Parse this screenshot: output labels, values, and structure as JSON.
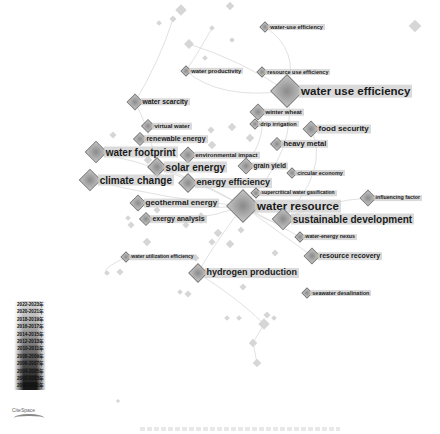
{
  "figure": {
    "title": "",
    "type": "keyword co-occurrence network (CiteSpace)",
    "caption_visible": false
  },
  "legend": {
    "items": [
      {
        "label": "2022-2023年",
        "color": "#cfcfcf"
      },
      {
        "label": "2020-2021年",
        "color": "#c2c2c2"
      },
      {
        "label": "2018-2019年",
        "color": "#b3b3b3"
      },
      {
        "label": "2016-2017年",
        "color": "#a3a3a3"
      },
      {
        "label": "2014-2015年",
        "color": "#929292"
      },
      {
        "label": "2012-2013年",
        "color": "#808080"
      },
      {
        "label": "2010-2011年",
        "color": "#6d6d6d"
      },
      {
        "label": "2008-2009年",
        "color": "#5a5a5a"
      },
      {
        "label": "2006-2007年",
        "color": "#474747"
      },
      {
        "label": "2004-2005年",
        "color": "#363636"
      },
      {
        "label": "2002-2003年",
        "color": "#262626"
      },
      {
        "label": "2000-2001年",
        "color": "#181818"
      }
    ],
    "logo": "CiteSpace"
  },
  "keywords": [
    {
      "label": "water-use efficiency",
      "x": 265,
      "y": 27,
      "size": 5.5,
      "node": 6
    },
    {
      "label": "water productivity",
      "x": 186,
      "y": 71,
      "size": 5.8,
      "node": 6
    },
    {
      "label": "resource use efficiency",
      "x": 262,
      "y": 72,
      "size": 5.5,
      "node": 6
    },
    {
      "label": "water use efficiency",
      "x": 287,
      "y": 91,
      "size": 11.5,
      "node": 22
    },
    {
      "label": "water scarcity",
      "x": 135,
      "y": 102,
      "size": 6.8,
      "node": 10
    },
    {
      "label": "winter wheat",
      "x": 258,
      "y": 112,
      "size": 6,
      "node": 10
    },
    {
      "label": "drip irrigation",
      "x": 255,
      "y": 124,
      "size": 5.6,
      "node": 6
    },
    {
      "label": "virtual water",
      "x": 148,
      "y": 126,
      "size": 6,
      "node": 8
    },
    {
      "label": "food security",
      "x": 311,
      "y": 129,
      "size": 8,
      "node": 10
    },
    {
      "label": "renewable energy",
      "x": 140,
      "y": 139,
      "size": 7,
      "node": 8
    },
    {
      "label": "heavy metal",
      "x": 277,
      "y": 144,
      "size": 7.5,
      "node": 8
    },
    {
      "label": "water footprint",
      "x": 96,
      "y": 152,
      "size": 10,
      "node": 14
    },
    {
      "label": "environmental impact",
      "x": 188,
      "y": 155,
      "size": 6,
      "node": 10
    },
    {
      "label": "solar energy",
      "x": 157,
      "y": 167,
      "size": 10,
      "node": 12
    },
    {
      "label": "grain yield",
      "x": 246,
      "y": 166,
      "size": 6.5,
      "node": 10
    },
    {
      "label": "circular economy",
      "x": 292,
      "y": 173,
      "size": 5.5,
      "node": 6
    },
    {
      "label": "climate change",
      "x": 90,
      "y": 180,
      "size": 10,
      "node": 14
    },
    {
      "label": "energy efficiency",
      "x": 188,
      "y": 183,
      "size": 9,
      "node": 12
    },
    {
      "label": "supercritical water gasification",
      "x": 256,
      "y": 193,
      "size": 5,
      "node": 6
    },
    {
      "label": "influencing factor",
      "x": 368,
      "y": 198,
      "size": 5.3,
      "node": 10
    },
    {
      "label": "geothermal energy",
      "x": 138,
      "y": 203,
      "size": 8,
      "node": 10
    },
    {
      "label": "water resource",
      "x": 243,
      "y": 206,
      "size": 11.5,
      "node": 22
    },
    {
      "label": "exergy analysis",
      "x": 146,
      "y": 219,
      "size": 7,
      "node": 8
    },
    {
      "label": "sustainable development",
      "x": 283,
      "y": 219,
      "size": 10,
      "node": 14
    },
    {
      "label": "water-energy nexus",
      "x": 300,
      "y": 237,
      "size": 5.3,
      "node": 6
    },
    {
      "label": "resource recovery",
      "x": 312,
      "y": 256,
      "size": 7,
      "node": 10
    },
    {
      "label": "water utilization efficiency",
      "x": 126,
      "y": 257,
      "size": 5,
      "node": 6
    },
    {
      "label": "hydrogen production",
      "x": 198,
      "y": 273,
      "size": 9,
      "node": 12
    },
    {
      "label": "seawater desalination",
      "x": 307,
      "y": 293,
      "size": 5.5,
      "node": 6
    }
  ],
  "minor_nodes": [
    [
      181,
      10,
      8
    ],
    [
      230,
      6,
      6
    ],
    [
      173,
      19,
      5
    ],
    [
      212,
      28,
      4
    ],
    [
      189,
      44,
      7
    ],
    [
      205,
      58,
      4
    ],
    [
      159,
      23,
      4
    ],
    [
      415,
      26,
      9
    ],
    [
      232,
      40,
      4
    ],
    [
      211,
      130,
      5
    ],
    [
      232,
      127,
      6
    ],
    [
      250,
      138,
      6
    ],
    [
      148,
      160,
      6
    ],
    [
      212,
      145,
      6
    ],
    [
      113,
      135,
      5
    ],
    [
      201,
      218,
      8
    ],
    [
      186,
      225,
      5
    ],
    [
      131,
      225,
      5
    ],
    [
      147,
      242,
      6
    ],
    [
      230,
      244,
      6
    ],
    [
      218,
      233,
      6
    ],
    [
      107,
      273,
      4
    ],
    [
      120,
      272,
      5
    ],
    [
      196,
      258,
      5
    ],
    [
      180,
      292,
      4
    ],
    [
      188,
      294,
      5
    ],
    [
      241,
      230,
      5
    ],
    [
      267,
      315,
      5
    ],
    [
      264,
      324,
      8
    ],
    [
      253,
      343,
      6
    ],
    [
      257,
      363,
      6
    ],
    [
      274,
      318,
      4
    ],
    [
      239,
      318,
      4
    ],
    [
      227,
      318,
      4
    ],
    [
      243,
      287,
      5
    ],
    [
      275,
      253,
      5
    ],
    [
      118,
      401,
      3
    ],
    [
      212,
      242,
      5
    ],
    [
      157,
      210,
      5
    ],
    [
      128,
      218,
      4
    ]
  ]
}
